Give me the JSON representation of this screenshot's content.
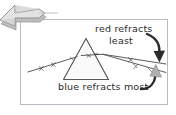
{
  "figure": {
    "type": "optics-dispersion-diagram",
    "caption_labels": {
      "red": "red refracts",
      "red_line2": "least",
      "blue": "blue refracts most"
    },
    "colors": {
      "ink": "#2b2b2b",
      "ray": "#4a4a4a",
      "frame": "#b9b9c4",
      "arrow_fill": "#d0d0d0",
      "arrow_stroke": "#8a8a8a",
      "paper": "#ffffff"
    },
    "elements": {
      "prism_name": "prism",
      "incoming_ray_name": "white-light-ray",
      "red_ray_name": "red-ray",
      "blue_ray_name": "blue-ray",
      "pointer_arrow_name": "pointer-arrow",
      "red_callout_arrow_name": "red-callout-arrow",
      "blue_callout_arrow_name": "blue-callout-arrow"
    }
  }
}
